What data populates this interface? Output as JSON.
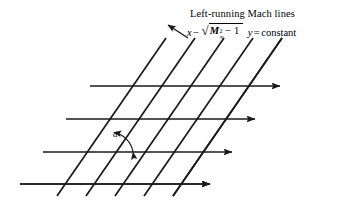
{
  "figure": {
    "name": "left-running-mach-lines",
    "background_color": "#ffffff",
    "line_color": "#1a1a1a",
    "width": 338,
    "height": 201
  },
  "caption": {
    "title": "Left-running Mach lines",
    "equation": {
      "lhs_variable": "x",
      "minus_sign": "−",
      "radical_sign": "√",
      "mach_symbol": "M",
      "mach_exponent": "2",
      "mach_subscript": "∞",
      "radicand_tail": "− 1",
      "y_variable": "y",
      "equals_sign": "=",
      "rhs": "constant",
      "plain_text": "x − √(M∞² − 1) y = constant"
    }
  },
  "annotations": {
    "angle_symbol": "α",
    "angle_description": "Mach angle between horizontal flow line and Mach line"
  },
  "chart_data": {
    "type": "diagram",
    "title": "Left-running Mach lines",
    "horizontal_lines": [
      {
        "x1": 113,
        "y1": 52,
        "x2": 302,
        "y2": 52
      },
      {
        "x1": 90,
        "y1": 86,
        "x2": 280,
        "y2": 86
      },
      {
        "x1": 66,
        "y1": 119,
        "x2": 255,
        "y2": 119
      },
      {
        "x1": 43,
        "y1": 152,
        "x2": 232,
        "y2": 152
      },
      {
        "x1": 20,
        "y1": 184,
        "x2": 210,
        "y2": 184
      }
    ],
    "mach_lines": [
      {
        "x1": 137,
        "y1": 38,
        "x2": 28,
        "y2": 196
      },
      {
        "x1": 166,
        "y1": 38,
        "x2": 57,
        "y2": 196
      },
      {
        "x1": 195,
        "y1": 38,
        "x2": 86,
        "y2": 196
      },
      {
        "x1": 224,
        "y1": 38,
        "x2": 115,
        "y2": 196
      },
      {
        "x1": 253,
        "y1": 38,
        "x2": 144,
        "y2": 196
      },
      {
        "x1": 282,
        "y1": 38,
        "x2": 173,
        "y2": 196
      }
    ],
    "pointer_arrow": {
      "x1": 188,
      "y1": 38,
      "x2": 168,
      "y2": 25
    },
    "angle_arc": {
      "vertex_x": 110,
      "vertex_y": 152,
      "radius": 24,
      "label": "α"
    },
    "arrowheads": "right-pointing on each horizontal line",
    "grid": false,
    "legend": "none"
  }
}
